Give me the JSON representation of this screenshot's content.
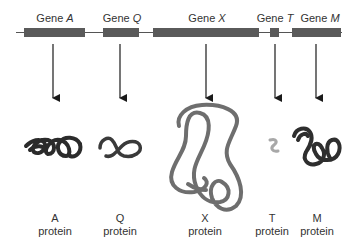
{
  "colors": {
    "chromosome_line": "#555555",
    "gene_bar": "#5a5a5a",
    "arrow": "#1a1a1a",
    "protein_dark": "#2b2b2b",
    "protein_mid": "#6e6e6e",
    "protein_light": "#a8a8a8"
  },
  "genes": [
    {
      "prefix": "Gene",
      "name": "A"
    },
    {
      "prefix": "Gene",
      "name": "Q"
    },
    {
      "prefix": "Gene",
      "name": "X"
    },
    {
      "prefix": "Gene",
      "name": "T"
    },
    {
      "prefix": "Gene",
      "name": "M"
    }
  ],
  "proteins": [
    {
      "name": "A",
      "suffix": "protein"
    },
    {
      "name": "Q",
      "suffix": "protein"
    },
    {
      "name": "X",
      "suffix": "protein"
    },
    {
      "name": "T",
      "suffix": "protein"
    },
    {
      "name": "M",
      "suffix": "protein"
    }
  ]
}
